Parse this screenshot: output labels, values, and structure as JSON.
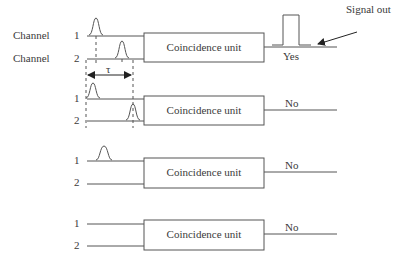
{
  "diagram": {
    "channel_label": "Channel",
    "signal_out_label": "Signal out",
    "tau_symbol": "τ",
    "unit_label": "Coincidence unit",
    "groups": [
      {
        "ch1": "1",
        "ch2": "2",
        "result": "Yes",
        "pulses": "both channels, within τ"
      },
      {
        "ch1": "1",
        "ch2": "2",
        "result": "No",
        "pulses": "both channels, separated by more than τ"
      },
      {
        "ch1": "1",
        "ch2": "2",
        "result": "No",
        "pulses": "channel 1 only"
      },
      {
        "ch1": "1",
        "ch2": "2",
        "result": "No",
        "pulses": "none"
      }
    ],
    "colors": {
      "line": "#555555",
      "text": "#3a3a3a"
    }
  }
}
